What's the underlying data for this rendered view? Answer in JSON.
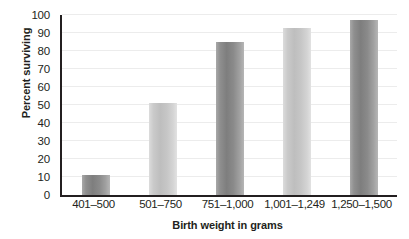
{
  "chart_data": {
    "type": "bar",
    "title": "",
    "xlabel": "Birth weight in grams",
    "ylabel": "Percent surviving",
    "categories": [
      "401–500",
      "501–750",
      "751–1,000",
      "1,001–1,249",
      "1,250–1,500"
    ],
    "values": [
      11,
      51,
      85,
      93,
      97
    ],
    "ylim": [
      0,
      100
    ],
    "ytick_labels": [
      "0",
      "10",
      "20",
      "30",
      "40",
      "50",
      "60",
      "70",
      "80",
      "90",
      "100"
    ],
    "ytick_values": [
      0,
      10,
      20,
      30,
      40,
      50,
      60,
      70,
      80,
      90,
      100
    ],
    "grid": "horizontal",
    "legend": "none",
    "bar_shading": [
      "dark",
      "light",
      "dark",
      "light",
      "dark"
    ],
    "colors": {
      "bar_dark": "#7e7e7e",
      "bar_light": "#bebebe",
      "axis": "#231f20",
      "gridline": "#ececec",
      "background": "#ffffff",
      "text": "#231f20"
    }
  }
}
